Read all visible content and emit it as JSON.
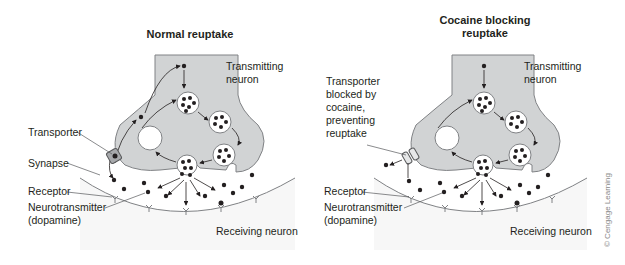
{
  "panels": [
    {
      "title": "Normal reuptake",
      "labels": {
        "transmitting_line1": "Transmitting",
        "transmitting_line2": "neuron",
        "transporter": "Transporter",
        "synapse": "Synapse",
        "receptor": "Receptor",
        "neurotransmitter_line1": "Neurotransmitter",
        "neurotransmitter_line2": "(dopamine)",
        "receiving": "Receiving neuron"
      }
    },
    {
      "title_line1": "Cocaine blocking",
      "title_line2": "reuptake",
      "labels": {
        "transmitting_line1": "Transmitting",
        "transmitting_line2": "neuron",
        "blocked_line1": "Transporter",
        "blocked_line2": "blocked by",
        "blocked_line3": "cocaine,",
        "blocked_line4": "preventing",
        "blocked_line5": "reuptake",
        "receptor": "Receptor",
        "neurotransmitter_line1": "Neurotransmitter",
        "neurotransmitter_line2": "(dopamine)",
        "receiving": "Receiving neuron"
      }
    }
  ],
  "credit": "© Cengage Learning",
  "colors": {
    "neuron_fill": "#d1d3d4",
    "neuron_stroke": "#808285",
    "dot": "#231f20",
    "text": "#231f20"
  }
}
